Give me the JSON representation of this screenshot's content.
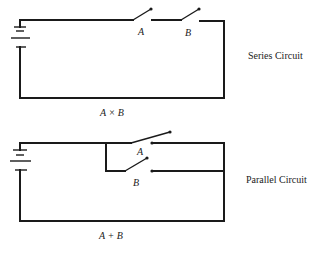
{
  "series": {
    "title": "Series Circuit",
    "switch_a_label": "A",
    "switch_b_label": "B",
    "expression": "A × B"
  },
  "parallel": {
    "title": "Parallel Circuit",
    "switch_a_label": "A",
    "switch_b_label": "B",
    "expression": "A + B"
  },
  "colors": {
    "ink": "#1a1a1a",
    "background": "#ffffff"
  }
}
